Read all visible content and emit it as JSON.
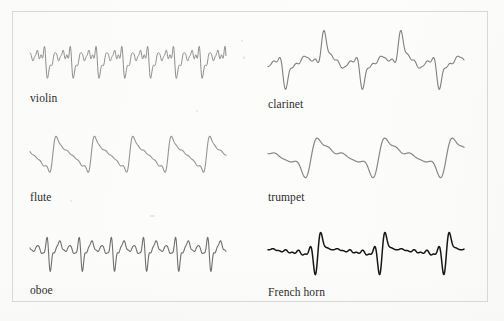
{
  "figure": {
    "background_color": "#fcfcfb",
    "border_color": "#d8d8d6"
  },
  "chart_data": {
    "type": "line",
    "subtitle": "",
    "xlabel": "",
    "ylabel": "",
    "grid": false,
    "legend_position": "inline-below-each-trace",
    "axis_ranges": {
      "x": [
        0,
        1
      ],
      "y": [
        -1,
        1
      ]
    },
    "series": [
      {
        "name": "violin",
        "label": "violin",
        "panel": "top-left",
        "stroke_color": "#8e8e8e",
        "stroke_width": 1.0,
        "cycles": 7.6,
        "amplitude": 1.0,
        "phase": 0.0,
        "harmonics": [
          {
            "n": 1,
            "amp": 0.52,
            "phase": 0.0
          },
          {
            "n": 2,
            "amp": 0.42,
            "phase": 1.9
          },
          {
            "n": 3,
            "amp": 0.34,
            "phase": 3.4
          },
          {
            "n": 4,
            "amp": 0.3,
            "phase": 0.7
          },
          {
            "n": 5,
            "amp": 0.22,
            "phase": 2.4
          },
          {
            "n": 6,
            "amp": 0.18,
            "phase": 4.6
          },
          {
            "n": 7,
            "amp": 0.12,
            "phase": 1.2
          },
          {
            "n": 8,
            "amp": 0.09,
            "phase": 5.1
          }
        ],
        "character": "bright, jagged, many strong upper partials"
      },
      {
        "name": "clarinet",
        "label": "clarinet",
        "panel": "top-right",
        "stroke_color": "#7f7f7f",
        "stroke_width": 1.1,
        "cycles": 2.55,
        "amplitude": 1.0,
        "phase": 3.35,
        "harmonics": [
          {
            "n": 1,
            "amp": 0.6,
            "phase": 0.0
          },
          {
            "n": 3,
            "amp": 0.46,
            "phase": 2.8
          },
          {
            "n": 5,
            "amp": 0.3,
            "phase": 0.5
          },
          {
            "n": 7,
            "amp": 0.22,
            "phase": 3.7
          },
          {
            "n": 9,
            "amp": 0.15,
            "phase": 1.4
          },
          {
            "n": 11,
            "amp": 0.1,
            "phase": 4.9
          },
          {
            "n": 2,
            "amp": 0.07,
            "phase": 2.0
          }
        ],
        "character": "odd harmonics dominant, tall narrow spike then plateau"
      },
      {
        "name": "flute",
        "label": "flute",
        "panel": "middle-left",
        "stroke_color": "#949494",
        "stroke_width": 1.1,
        "cycles": 5.1,
        "amplitude": 1.0,
        "phase": 2.6,
        "harmonics": [
          {
            "n": 1,
            "amp": 0.7,
            "phase": 0.0
          },
          {
            "n": 2,
            "amp": 0.38,
            "phase": 2.6
          },
          {
            "n": 3,
            "amp": 0.24,
            "phase": 5.0
          },
          {
            "n": 4,
            "amp": 0.16,
            "phase": 1.1
          },
          {
            "n": 5,
            "amp": 0.1,
            "phase": 3.9
          },
          {
            "n": 6,
            "amp": 0.06,
            "phase": 0.4
          }
        ],
        "character": "nearly sinusoidal with a single tall narrow crest per period"
      },
      {
        "name": "trumpet",
        "label": "trumpet",
        "panel": "middle-right",
        "stroke_color": "#868686",
        "stroke_width": 1.2,
        "cycles": 2.9,
        "amplitude": 1.0,
        "phase": 2.2,
        "harmonics": [
          {
            "n": 1,
            "amp": 0.62,
            "phase": 0.0
          },
          {
            "n": 2,
            "amp": 0.4,
            "phase": 2.2
          },
          {
            "n": 3,
            "amp": 0.3,
            "phase": 4.4
          },
          {
            "n": 4,
            "amp": 0.18,
            "phase": 0.9
          },
          {
            "n": 5,
            "amp": 0.1,
            "phase": 3.1
          }
        ],
        "character": "one tall peak then two smaller rounded humps, deep valley"
      },
      {
        "name": "oboe",
        "label": "oboe",
        "panel": "bottom-left",
        "stroke_color": "#6f6f6f",
        "stroke_width": 1.1,
        "cycles": 6.1,
        "amplitude": 1.0,
        "phase": 1.0,
        "harmonics": [
          {
            "n": 1,
            "amp": 0.34,
            "phase": 0.0
          },
          {
            "n": 2,
            "amp": 0.4,
            "phase": 1.6
          },
          {
            "n": 3,
            "amp": 0.44,
            "phase": 3.2
          },
          {
            "n": 4,
            "amp": 0.36,
            "phase": 0.4
          },
          {
            "n": 5,
            "amp": 0.3,
            "phase": 2.9
          },
          {
            "n": 6,
            "amp": 0.22,
            "phase": 5.2
          },
          {
            "n": 7,
            "amp": 0.16,
            "phase": 1.8
          },
          {
            "n": 8,
            "amp": 0.11,
            "phase": 4.1
          }
        ],
        "character": "reedy, dense, strong mid harmonics, spiky crests"
      },
      {
        "name": "French horn",
        "label": "French horn",
        "panel": "bottom-right",
        "stroke_color": "#161616",
        "stroke_width": 1.5,
        "cycles": 3.05,
        "amplitude": 1.0,
        "phase": 1.5,
        "harmonics": [
          {
            "n": 1,
            "amp": 0.3,
            "phase": 0.0
          },
          {
            "n": 2,
            "amp": 0.26,
            "phase": 1.2
          },
          {
            "n": 3,
            "amp": 0.3,
            "phase": 2.5
          },
          {
            "n": 4,
            "amp": 0.34,
            "phase": 3.8
          },
          {
            "n": 5,
            "amp": 0.4,
            "phase": 5.1
          },
          {
            "n": 6,
            "amp": 0.36,
            "phase": 0.6
          },
          {
            "n": 7,
            "amp": 0.28,
            "phase": 2.1
          },
          {
            "n": 8,
            "amp": 0.2,
            "phase": 3.6
          },
          {
            "n": 9,
            "amp": 0.14,
            "phase": 5.0
          },
          {
            "n": 10,
            "amp": 0.09,
            "phase": 1.0
          }
        ],
        "character": "dark heavy ink, rapid dense oscillation with deep periodic spikes"
      }
    ]
  },
  "panels": [
    {
      "key": "violin",
      "x": 30,
      "y": 30,
      "w": 196,
      "h": 58,
      "label_x": 30,
      "label_y": 92
    },
    {
      "key": "clarinet",
      "x": 268,
      "y": 26,
      "w": 196,
      "h": 70,
      "label_x": 268,
      "label_y": 98
    },
    {
      "key": "flute",
      "x": 30,
      "y": 126,
      "w": 196,
      "h": 58,
      "label_x": 30,
      "label_y": 191
    },
    {
      "key": "trumpet",
      "x": 268,
      "y": 126,
      "w": 196,
      "h": 60,
      "label_x": 268,
      "label_y": 191
    },
    {
      "key": "oboe",
      "x": 30,
      "y": 222,
      "w": 196,
      "h": 56,
      "label_x": 30,
      "label_y": 284
    },
    {
      "key": "French horn",
      "x": 268,
      "y": 220,
      "w": 196,
      "h": 62,
      "label_x": 268,
      "label_y": 286
    }
  ],
  "specks": [
    {
      "x": 241,
      "y": 40,
      "w": 2,
      "h": 2
    },
    {
      "x": 243,
      "y": 56,
      "w": 2,
      "h": 3
    },
    {
      "x": 150,
      "y": 215,
      "w": 5,
      "h": 2
    },
    {
      "x": 196,
      "y": 110,
      "w": 2,
      "h": 2
    },
    {
      "x": 70,
      "y": 200,
      "w": 2,
      "h": 2
    }
  ]
}
